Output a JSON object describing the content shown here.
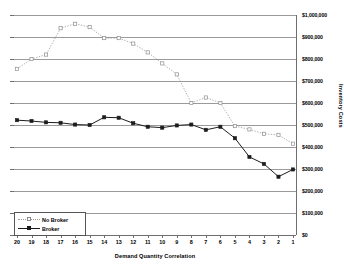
{
  "chart_data": {
    "type": "line",
    "title": "",
    "xlabel": "Demand Quantity Correlation",
    "ylabel": "Inventory Costs",
    "categories": [
      "20",
      "19",
      "18",
      "17",
      "16",
      "15",
      "14",
      "13",
      "12",
      "11",
      "10",
      "9",
      "8",
      "7",
      "6",
      "5",
      "4",
      "3",
      "2",
      "1"
    ],
    "ylim": [
      0,
      1000000
    ],
    "ytick_values": [
      0,
      100000,
      200000,
      300000,
      400000,
      500000,
      600000,
      700000,
      800000,
      900000,
      1000000
    ],
    "ytick_labels": [
      "$0",
      "$100,000",
      "$200,000",
      "$300,000",
      "$400,000",
      "$500,000",
      "$600,000",
      "$700,000",
      "$800,000",
      "$900,000",
      "$1,000,000"
    ],
    "grid": true,
    "legend_position": "bottom-left",
    "series": [
      {
        "name": "No Broker",
        "style": "dotted",
        "marker": "open-square",
        "color": "#8f8f8f",
        "values": [
          755000,
          800000,
          820000,
          940000,
          960000,
          945000,
          895000,
          895000,
          870000,
          830000,
          780000,
          730000,
          600000,
          625000,
          600000,
          495000,
          480000,
          460000,
          455000,
          415000
        ]
      },
      {
        "name": "Broker",
        "style": "solid",
        "marker": "filled-square",
        "color": "#1c1c1c",
        "values": [
          522000,
          518000,
          512000,
          510000,
          502000,
          500000,
          535000,
          533000,
          508000,
          492000,
          488000,
          498000,
          502000,
          478000,
          492000,
          440000,
          355000,
          323000,
          265000,
          298000
        ]
      }
    ]
  },
  "legend": {
    "items": [
      {
        "label": "No Broker"
      },
      {
        "label": "Broker"
      }
    ]
  }
}
